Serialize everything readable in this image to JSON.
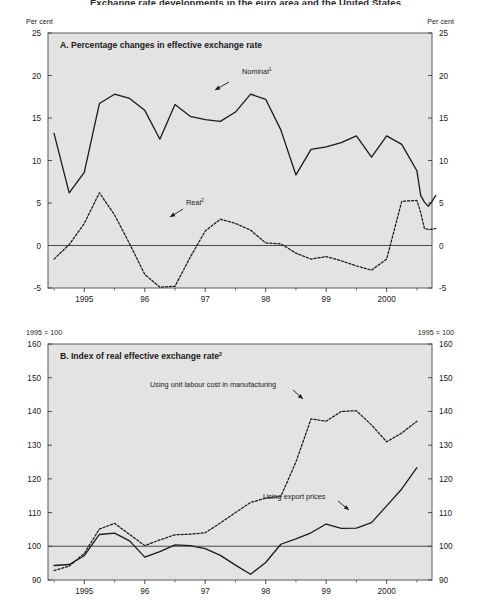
{
  "figure": {
    "title": "Exchange rate developments in the euro area and the United States",
    "background": "#e3e3e3",
    "frame_color": "#5a5a5a"
  },
  "panelA": {
    "title": "A.  Percentage changes in effective exchange rate",
    "unit_left": "Per cent",
    "unit_right": "Per cent",
    "y_ticks": [
      25,
      20,
      15,
      10,
      5,
      0,
      -5
    ],
    "y_min": -5,
    "y_max": 25,
    "x_ticks": [
      "1995",
      "96",
      "97",
      "98",
      "99",
      "2000"
    ],
    "x_min": 1994.4,
    "x_max": 2000.75,
    "zero_line": 0,
    "annotations": [
      {
        "name": "nominal",
        "text": "Nominal",
        "sup": "1",
        "x": 242,
        "y": 74,
        "arrow_from_x": 229,
        "arrow_from_y": 82,
        "arrow_to_x": 215,
        "arrow_to_y": 90
      },
      {
        "name": "real",
        "text": "Real",
        "sup": "2",
        "x": 186,
        "y": 205,
        "arrow_from_x": 183,
        "arrow_from_y": 209,
        "arrow_to_x": 170,
        "arrow_to_y": 217
      }
    ]
  },
  "panelB": {
    "title": "B.  Index of real effective exchange rate",
    "title_sup": "2",
    "unit_left": "1995 = 100",
    "unit_right": "1995 = 100",
    "y_ticks": [
      160,
      150,
      140,
      130,
      120,
      110,
      100,
      90
    ],
    "y_min": 90,
    "y_max": 160,
    "x_ticks": [
      "1995",
      "96",
      "97",
      "98",
      "99",
      "2000"
    ],
    "x_min": 1994.4,
    "x_max": 2000.75,
    "base_line": 100,
    "annotations": [
      {
        "name": "unit-labour-cost",
        "text": "Using unit labour cost in manufacturing",
        "x": 150,
        "y": 387,
        "arrow_from_x": 293,
        "arrow_from_y": 390,
        "arrow_to_x": 303,
        "arrow_to_y": 399
      },
      {
        "name": "export-prices",
        "text": "Using export prices",
        "x": 263,
        "y": 499,
        "arrow_from_x": 338,
        "arrow_from_y": 501,
        "arrow_to_x": 349,
        "arrow_to_y": 510
      }
    ]
  },
  "chart_data": [
    {
      "type": "line",
      "panel": "A",
      "title": "A.  Percentage changes in effective exchange rate",
      "xlabel": "",
      "ylabel": "Per cent",
      "ylim": [
        -5,
        25
      ],
      "xlim": [
        1994.4,
        2000.75
      ],
      "grid": false,
      "x_tick_labels": [
        "1995",
        "96",
        "97",
        "98",
        "99",
        "2000"
      ],
      "x_tick_values": [
        1995,
        1996,
        1997,
        1998,
        1999,
        2000
      ],
      "y_tick_values": [
        25,
        20,
        15,
        10,
        5,
        0,
        -5
      ],
      "legend": "inline-annotations",
      "series": [
        {
          "name": "Nominal",
          "footnote": "1",
          "style": "solid",
          "x": [
            1994.5,
            1994.75,
            1995.0,
            1995.25,
            1995.5,
            1995.75,
            1996.0,
            1996.25,
            1996.5,
            1996.75,
            1997.0,
            1997.25,
            1997.5,
            1997.75,
            1998.0,
            1998.25,
            1998.5,
            1998.75,
            1999.0,
            1999.25,
            1999.5,
            1999.75,
            2000.0,
            2000.25,
            2000.5
          ],
          "values": [
            13.2,
            6.2,
            8.6,
            16.7,
            17.8,
            17.3,
            15.9,
            12.5,
            16.6,
            15.2,
            14.8,
            14.6,
            15.7,
            17.8,
            17.2,
            13.6,
            8.3,
            11.3,
            11.6,
            12.1,
            12.9,
            10.4,
            12.9,
            11.9,
            8.8
          ]
        },
        {
          "name": "Real",
          "footnote": "2",
          "style": "dashed",
          "x": [
            1994.5,
            1994.75,
            1995.0,
            1995.25,
            1995.5,
            1995.75,
            1996.0,
            1996.25,
            1996.5,
            1996.75,
            1997.0,
            1997.25,
            1997.5,
            1997.75,
            1998.0,
            1998.25,
            1998.5,
            1998.75,
            1999.0,
            1999.25,
            1999.5,
            1999.75,
            2000.0,
            2000.25,
            2000.5
          ],
          "values": [
            -1.6,
            0.1,
            2.6,
            6.2,
            3.6,
            0.2,
            -3.4,
            -4.9,
            -4.8,
            -1.4,
            1.7,
            3.1,
            2.6,
            1.8,
            0.3,
            0.2,
            -0.9,
            -1.6,
            -1.3,
            -1.8,
            -2.4,
            -2.9,
            -1.6,
            5.2,
            5.3
          ]
        }
      ],
      "tail_nominal": [
        8.8,
        5.9,
        5.1,
        4.6,
        5.2,
        5.9
      ],
      "tail_real": [
        5.3,
        3.9,
        2.0,
        1.9,
        1.9,
        2.0
      ]
    },
    {
      "type": "line",
      "panel": "B",
      "title": "B.  Index of real effective exchange rate",
      "xlabel": "",
      "ylabel": "1995 = 100",
      "ylim": [
        90,
        160
      ],
      "xlim": [
        1994.4,
        2000.75
      ],
      "grid": false,
      "x_tick_labels": [
        "1995",
        "96",
        "97",
        "98",
        "99",
        "2000"
      ],
      "x_tick_values": [
        1995,
        1996,
        1997,
        1998,
        1999,
        2000
      ],
      "y_tick_values": [
        160,
        150,
        140,
        130,
        120,
        110,
        100,
        90
      ],
      "legend": "inline-annotations",
      "series": [
        {
          "name": "Using export prices",
          "style": "solid",
          "x": [
            1994.5,
            1994.75,
            1995.0,
            1995.25,
            1995.5,
            1995.75,
            1996.0,
            1996.25,
            1996.5,
            1996.75,
            1997.0,
            1997.25,
            1997.5,
            1997.75,
            1998.0,
            1998.25,
            1998.5,
            1998.75,
            1999.0,
            1999.25,
            1999.5,
            1999.75,
            2000.0,
            2000.25,
            2000.5
          ],
          "values": [
            94.3,
            94.6,
            97.2,
            103.5,
            103.9,
            101.6,
            96.8,
            98.4,
            100.4,
            100.2,
            99.3,
            97.3,
            94.4,
            91.7,
            95.2,
            100.6,
            102.2,
            104.0,
            106.6,
            105.3,
            105.4,
            107.0,
            112.0,
            117.0,
            123.3
          ]
        },
        {
          "name": "Using unit labour cost in manufacturing",
          "style": "dashed",
          "x": [
            1994.5,
            1994.75,
            1995.0,
            1995.25,
            1995.5,
            1995.75,
            1996.0,
            1996.25,
            1996.5,
            1996.75,
            1997.0,
            1997.25,
            1997.5,
            1997.75,
            1998.0,
            1998.25,
            1998.5,
            1998.75,
            1999.0,
            1999.25,
            1999.5,
            1999.75,
            2000.0,
            2000.25,
            2000.5
          ],
          "values": [
            92.8,
            94.1,
            97.9,
            105.1,
            106.8,
            103.5,
            100.2,
            101.9,
            103.4,
            103.6,
            104.0,
            106.9,
            110.0,
            113.0,
            114.3,
            114.8,
            125.0,
            137.8,
            137.1,
            140.0,
            140.2,
            136.0,
            131.0,
            133.6,
            137.1
          ]
        }
      ]
    }
  ]
}
